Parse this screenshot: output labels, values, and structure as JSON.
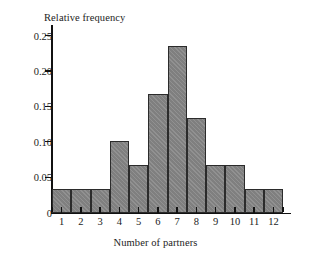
{
  "chart_data": {
    "type": "bar",
    "title": "",
    "xlabel": "Number of partners",
    "ylabel": "Relative frequency",
    "categories": [
      "1",
      "2",
      "3",
      "4",
      "5",
      "6",
      "7",
      "8",
      "9",
      "10",
      "11",
      "12"
    ],
    "values": [
      0.033,
      0.033,
      0.033,
      0.101,
      0.067,
      0.167,
      0.235,
      0.134,
      0.067,
      0.067,
      0.033,
      0.033
    ],
    "ylim": [
      0,
      0.265
    ],
    "xlim": [
      0.5,
      12.5
    ],
    "y_ticks": [
      0,
      0.05,
      0.1,
      0.15,
      0.2,
      0.25
    ],
    "y_tick_labels": [
      "0",
      "0.05",
      "0.10",
      "0.15",
      "0.20",
      "0.25"
    ],
    "x_ticks": [
      1,
      2,
      3,
      4,
      5,
      6,
      7,
      8,
      9,
      10,
      11,
      12
    ],
    "x_tick_labels": [
      "1",
      "2",
      "3",
      "4",
      "5",
      "6",
      "7",
      "8",
      "9",
      "10",
      "11",
      "12"
    ],
    "grid": false,
    "legend": null,
    "bar_color": "#858585",
    "bar_edge_color": "#2b2b2b",
    "axis_color": "#111111",
    "background": "#ffffff"
  }
}
